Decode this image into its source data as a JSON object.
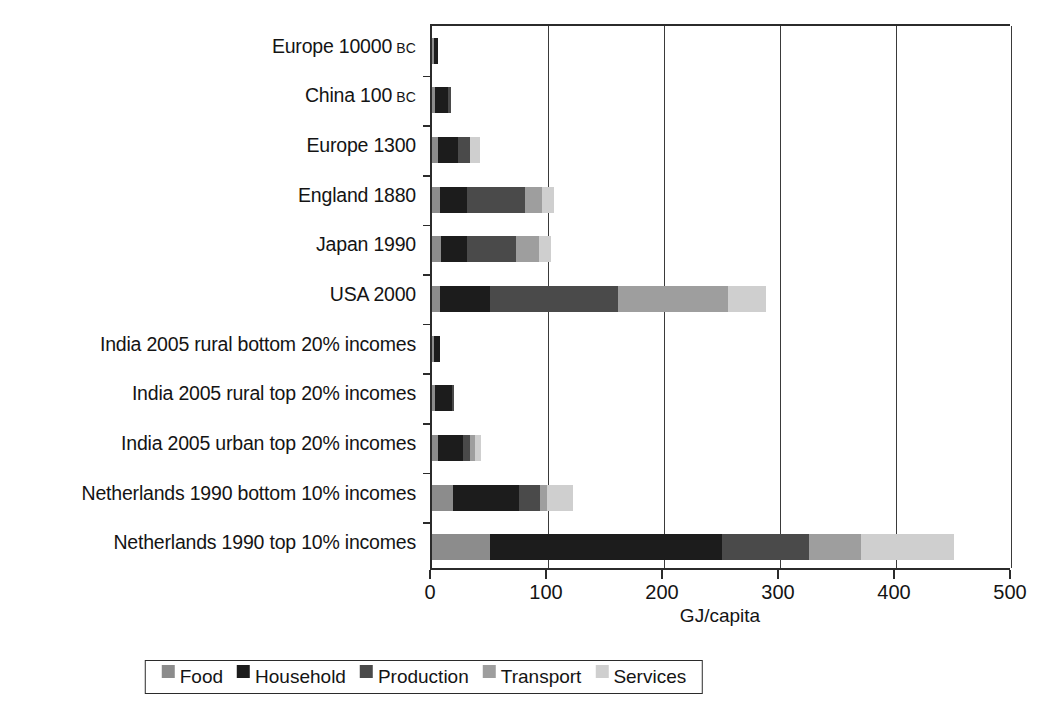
{
  "chart_data": {
    "type": "bar",
    "orientation": "horizontal",
    "stacked": true,
    "title": "",
    "xlabel": "GJ/capita",
    "ylabel": "",
    "xlim": [
      0,
      500
    ],
    "xticks": [
      0,
      100,
      200,
      300,
      400,
      500
    ],
    "xtick_labels": [
      "0",
      "100",
      "200",
      "300",
      "400",
      "500"
    ],
    "grid": "vertical gridlines at 100, 200, 300, 400",
    "legend_position": "bottom-center",
    "categories": [
      "Europe 10000 BC",
      "China 100 BC",
      "Europe 1300",
      "England 1880",
      "Japan 1990",
      "USA 2000",
      "India 2005 rural bottom 20% incomes",
      "India 2005 rural top 20% incomes",
      "India 2005 urban top 20% incomes",
      "Netherlands 1990 bottom 10% incomes",
      "Netherlands 1990 top 10% incomes"
    ],
    "category_parts": [
      {
        "main": "Europe 10000",
        "era": "BC"
      },
      {
        "main": "China 100",
        "era": "BC"
      },
      {
        "main": "Europe 1300",
        "era": ""
      },
      {
        "main": "England 1880",
        "era": ""
      },
      {
        "main": "Japan 1990",
        "era": ""
      },
      {
        "main": "USA 2000",
        "era": ""
      },
      {
        "main": "India 2005 rural bottom 20% incomes",
        "era": ""
      },
      {
        "main": "India 2005 rural top 20% incomes",
        "era": ""
      },
      {
        "main": "India 2005 urban top 20% incomes",
        "era": ""
      },
      {
        "main": "Netherlands 1990 bottom 10% incomes",
        "era": ""
      },
      {
        "main": "Netherlands 1990 top 10% incomes",
        "era": ""
      }
    ],
    "series": [
      {
        "name": "Food",
        "color": "#8c8c8c",
        "values": [
          1.5,
          3,
          5,
          7,
          8,
          7,
          1.5,
          3,
          5,
          18,
          50
        ]
      },
      {
        "name": "Household",
        "color": "#1c1c1c",
        "values": [
          4,
          11,
          17,
          23,
          22,
          43,
          5,
          14,
          22,
          57,
          200
        ]
      },
      {
        "name": "Production",
        "color": "#4a4a4a",
        "values": [
          0,
          2,
          11,
          50,
          42,
          110,
          0,
          2,
          6,
          18,
          75
        ]
      },
      {
        "name": "Transport",
        "color": "#9e9e9e",
        "values": [
          0,
          0,
          0,
          15,
          20,
          95,
          0,
          0,
          4,
          6,
          45
        ]
      },
      {
        "name": "Services",
        "color": "#cfcfcf",
        "values": [
          0,
          0,
          8,
          10,
          11,
          33,
          0,
          0,
          5,
          23,
          80
        ]
      }
    ],
    "totals": [
      5.5,
      16,
      41,
      105,
      103,
      288,
      6.5,
      19,
      42,
      122,
      450
    ],
    "units": "GJ/capita"
  },
  "legend": {
    "items": [
      {
        "label": "Food",
        "swatch": "#8c8c8c"
      },
      {
        "label": "Household",
        "swatch": "#1c1c1c"
      },
      {
        "label": "Production",
        "swatch": "#4a4a4a"
      },
      {
        "label": "Transport",
        "swatch": "#9e9e9e"
      },
      {
        "label": "Services",
        "swatch": "#cfcfcf"
      }
    ]
  },
  "axis": {
    "x_title": "GJ/capita"
  }
}
